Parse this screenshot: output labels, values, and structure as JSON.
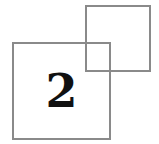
{
  "badge": {
    "number": "2",
    "border_color": "#8a8a8a",
    "text_color": "#111111"
  }
}
